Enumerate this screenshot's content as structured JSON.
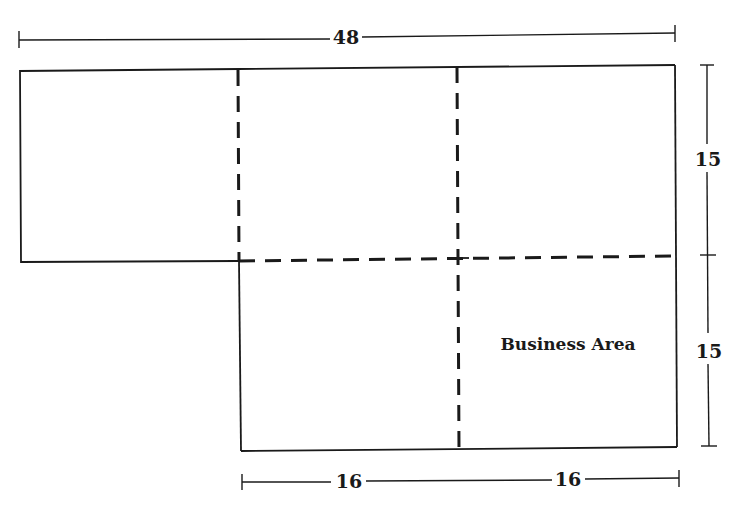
{
  "diagram": {
    "type": "floor-plan",
    "dimensions": {
      "top_width": "48",
      "right_upper_height": "15",
      "right_lower_height": "15",
      "bottom_left_width": "16",
      "bottom_right_width": "16"
    },
    "labels": {
      "business_area": "Business Area"
    },
    "colors": {
      "line": "#1a1a1a",
      "background": "#ffffff"
    }
  }
}
